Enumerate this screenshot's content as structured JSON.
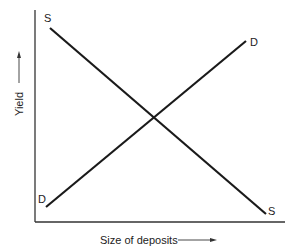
{
  "diagram": {
    "title": "",
    "axes": {
      "y_label": "Yield",
      "x_label": "Size of deposits"
    },
    "curves": [
      {
        "name": "supply",
        "label_start": "S",
        "label_end": "S",
        "direction": "downward-sloping"
      },
      {
        "name": "demand",
        "label_start": "D",
        "label_end": "D",
        "direction": "upward-sloping"
      }
    ],
    "colors": {
      "line": "#1a1a1a",
      "axis": "#333333",
      "text": "#222222",
      "background": "#ffffff"
    }
  }
}
